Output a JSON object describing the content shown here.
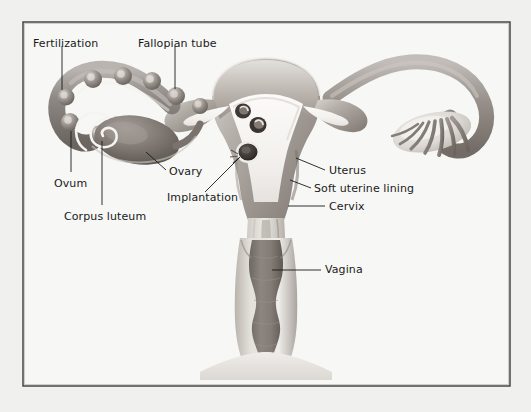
{
  "figure": {
    "frame": {
      "border_color": "#3a3a3a",
      "background_color": "#f7f7f5",
      "outer_background": "#f0f0ee"
    },
    "text_color": "#1a1a1a",
    "leader_color": "#1a1a1a"
  },
  "labels": [
    {
      "id": "fertilization",
      "text": "Fertilization",
      "x": 33,
      "y": 38
    },
    {
      "id": "fallopian-tube",
      "text": "Fallopian tube",
      "x": 138,
      "y": 38
    },
    {
      "id": "ovum",
      "text": "Ovum",
      "x": 54,
      "y": 178
    },
    {
      "id": "corpus-luteum",
      "text": "Corpus luteum",
      "x": 64,
      "y": 211
    },
    {
      "id": "ovary",
      "text": "Ovary",
      "x": 169,
      "y": 173
    },
    {
      "id": "implantation",
      "text": "Implantation",
      "x": 167,
      "y": 199
    },
    {
      "id": "uterus",
      "text": "Uterus",
      "x": 329,
      "y": 173
    },
    {
      "id": "soft-uterine-lining",
      "text": "Soft uterine lining",
      "x": 314,
      "y": 191
    },
    {
      "id": "cervix",
      "text": "Cervix",
      "x": 329,
      "y": 209
    },
    {
      "id": "vagina",
      "text": "Vagina",
      "x": 325,
      "y": 266
    }
  ],
  "anatomy_parts": [
    "left fallopian tube with ovum progression",
    "left ovary with corpus luteum",
    "uterus body",
    "soft uterine lining (endometrium)",
    "implantation site",
    "cervix",
    "vagina",
    "right fallopian tube with fimbriae",
    "right ovary"
  ]
}
